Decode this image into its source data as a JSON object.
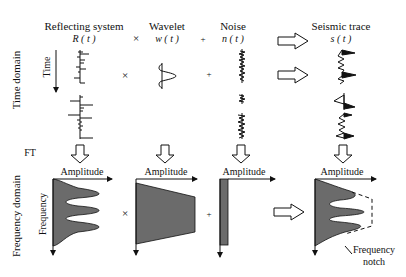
{
  "row_labels": {
    "time_domain": "Time domain",
    "ft": "FT",
    "frequency_domain": "Frequency domain"
  },
  "axis_labels": {
    "time": "Time",
    "frequency": "Frequency",
    "amplitude": "Amplitude"
  },
  "columns": [
    {
      "name": "Reflecting system",
      "symbol": "R ( t )"
    },
    {
      "name": "Wavelet",
      "symbol": "w ( t )"
    },
    {
      "name": "Noise",
      "symbol": "n ( t )"
    },
    {
      "name": "Seismic trace",
      "symbol": "s ( t )"
    }
  ],
  "operators": {
    "convolve": "×",
    "add": "+",
    "multiply": "×"
  },
  "annotations": {
    "notch_line1": "Frequency",
    "notch_line2": "notch"
  },
  "colors": {
    "fill": "#6b6b6b",
    "line": "#111111"
  }
}
